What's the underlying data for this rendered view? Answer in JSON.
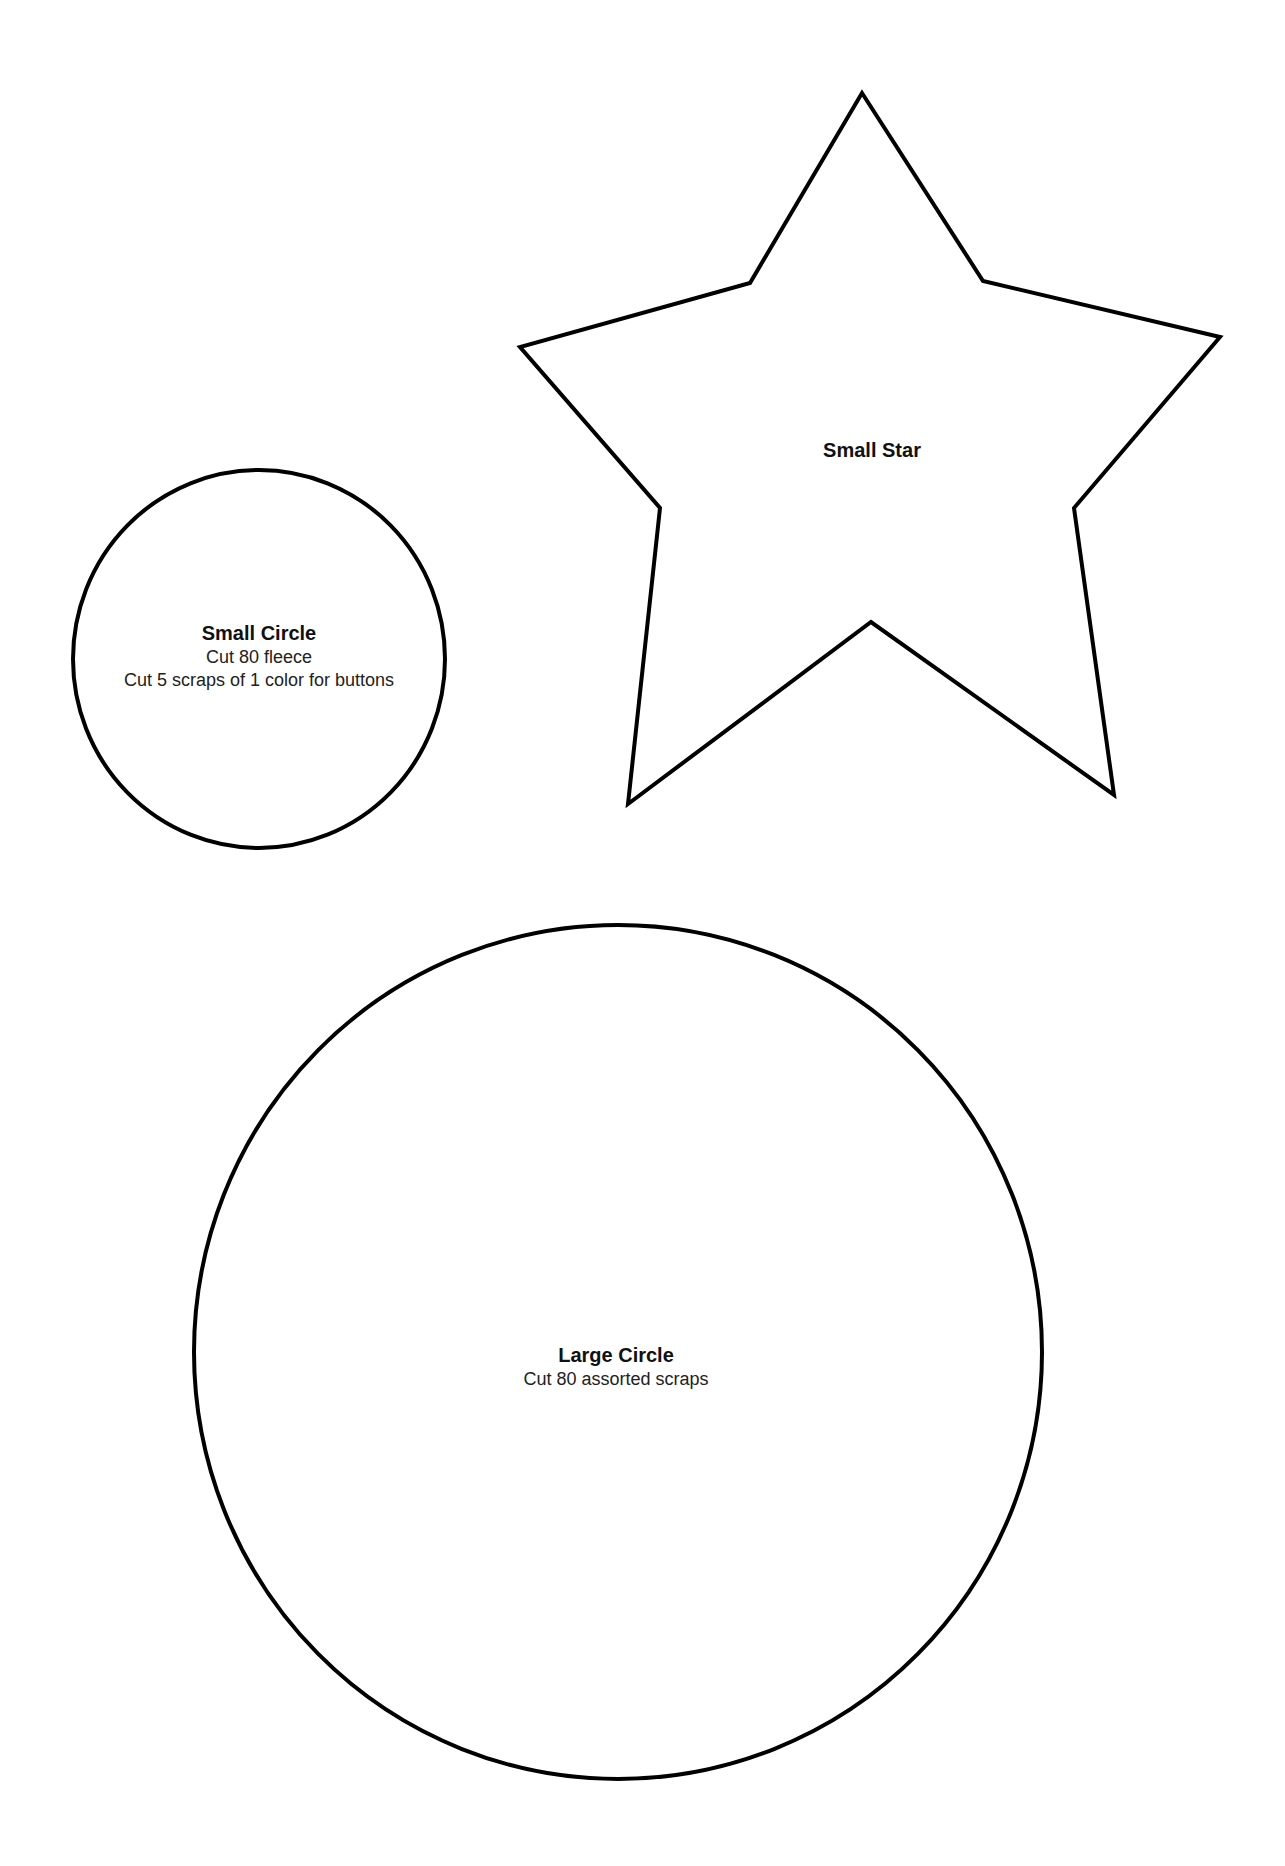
{
  "page": {
    "background": "#ffffff",
    "stroke_color": "#000000"
  },
  "shapes": {
    "small_circle": {
      "title": "Small Circle",
      "lines": [
        "Cut 80 fleece",
        "Cut 5 scraps of 1 color for buttons"
      ]
    },
    "small_star": {
      "title": "Small Star"
    },
    "large_circle": {
      "title": "Large Circle",
      "lines": [
        "Cut 80 assorted scraps"
      ]
    }
  }
}
